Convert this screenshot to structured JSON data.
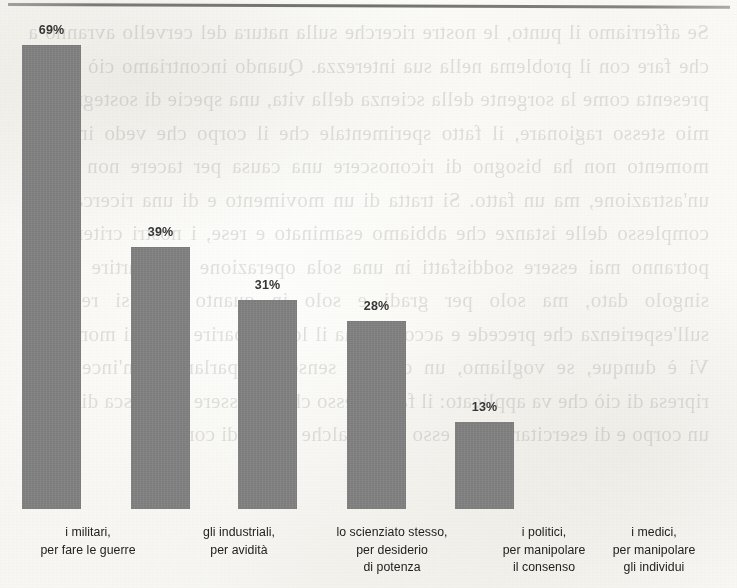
{
  "page": {
    "background_color": "#fbfbf9",
    "scan_edge_line_color": "#545454",
    "bleed_through_text": "Se afferriamo il punto, le nostre ricerche sulla natura del cervello avranno a che fare con il problema nella sua interezza. Quando incontriamo ciò che si presenta come la sorgente della scienza della vita, una specie di sostegno del mio stesso ragionare, il fatto sperimentale che il corpo che vedo in ogni momento non ha bisogno di riconoscere una causa per tacere non è più un'astrazione, ma un fatto. Si tratta di un movimento e di una ricerca. Nel complesso delle istanze che abbiamo esaminato e rese, i nostri criteri non potranno mai essere soddisfatti in una sola operazione e a partire da un singolo dato, ma solo per gradi e solo in quanto essi si reggano sull'esperienza che precede e accompagna il loro apparire in ogni momento. Vi è dunque, se vogliamo, un duplice senso del parlare e un'incessante ripresa di ciò che va applicato: il fatto stesso che un essere riconosca di avere un corpo e di esercitare su di esso una qualche forma di controllo."
  },
  "chart_data": {
    "type": "bar",
    "title": "",
    "subtitle": "",
    "xlabel": "",
    "ylabel": "",
    "ylim": [
      0,
      75
    ],
    "grid": false,
    "legend": "none",
    "bar_color": "#808080",
    "value_suffix": "%",
    "categories": [
      "i militari,\nper fare le guerre",
      "gli industriali,\nper avidità",
      "lo scienziato stesso,\nper desiderio\ndi potenza",
      "i politici,\nper manipolare\nil consenso",
      "i medici,\nper manipolare\ngli individui"
    ],
    "category_lines": [
      [
        "i militari,",
        "per fare le guerre"
      ],
      [
        "gli industriali,",
        "per avidità"
      ],
      [
        "lo scienziato stesso,",
        "per desiderio",
        "di potenza"
      ],
      [
        "i politici,",
        "per manipolare",
        "il consenso"
      ],
      [
        "i medici,",
        "per manipolare",
        "gli individui"
      ]
    ],
    "values": [
      69,
      39,
      31,
      28,
      13
    ],
    "value_labels": [
      "69%",
      "39%",
      "31%",
      "28%",
      "13%"
    ],
    "bars": [
      {
        "label": "i militari, per fare le guerre",
        "value": 69,
        "value_label": "69%",
        "left": 22,
        "width": 59
      },
      {
        "label": "gli industriali, per avidità",
        "value": 39,
        "value_label": "39%",
        "left": 131,
        "width": 59
      },
      {
        "label": "lo scienziato stesso, per desiderio di potenza",
        "value": 31,
        "value_label": "31%",
        "left": 238,
        "width": 59
      },
      {
        "label": "i politici, per manipolare il consenso",
        "value": 28,
        "value_label": "28%",
        "left": 347,
        "width": 59
      },
      {
        "label": "i medici, per manipolare gli individui",
        "value": 13,
        "value_label": "13%",
        "left": 455,
        "width": 59
      }
    ],
    "label_centers": [
      88,
      239,
      392,
      544,
      654
    ],
    "label_widths": [
      176,
      176,
      190,
      190,
      166
    ]
  }
}
